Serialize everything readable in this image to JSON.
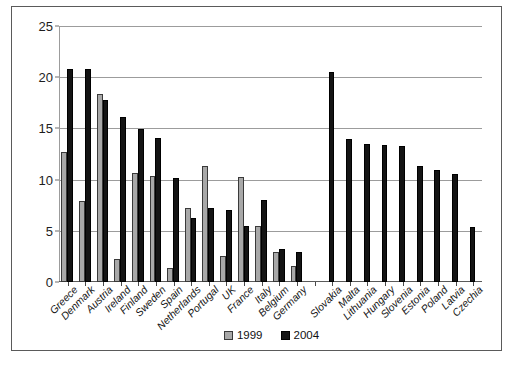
{
  "chart_data": {
    "type": "bar",
    "title": "",
    "subtitle": "",
    "xlabel": "",
    "ylabel": "",
    "ylim": [
      0,
      25
    ],
    "yticks": [
      0,
      5,
      10,
      15,
      20,
      25
    ],
    "grid": true,
    "legend_position": "bottom-center",
    "categories": [
      "Greece",
      "Denmark",
      "Austria",
      "Ireland",
      "Finland",
      "Sweden",
      "Spain",
      "Netherlands",
      "Portugal",
      "UK",
      "France",
      "Italy",
      "Belgium",
      "Germany",
      "",
      "Slovakia",
      "Malta",
      "Lithuania",
      "Hungary",
      "Slovenia",
      "Estonia",
      "Poland",
      "Latvia",
      "Czechia"
    ],
    "series": [
      {
        "name": "1999",
        "color": "#a8a8a8",
        "values": [
          12.7,
          7.9,
          18.4,
          2.2,
          10.6,
          10.4,
          1.4,
          7.2,
          11.3,
          2.5,
          10.3,
          5.5,
          2.9,
          1.6,
          null,
          null,
          null,
          null,
          null,
          null,
          null,
          null,
          null,
          null
        ]
      },
      {
        "name": "2004",
        "color": "#141414",
        "values": [
          20.8,
          20.8,
          17.8,
          16.1,
          14.9,
          14.1,
          10.2,
          6.3,
          7.2,
          7.0,
          5.5,
          8.0,
          3.2,
          2.9,
          null,
          20.5,
          14.0,
          13.5,
          13.4,
          13.3,
          11.3,
          10.9,
          10.5,
          5.4
        ]
      }
    ]
  },
  "legend": {
    "entries": [
      {
        "label": "1999",
        "swatch": "gray-square-swatch"
      },
      {
        "label": "2004",
        "swatch": "black-square-swatch"
      }
    ]
  },
  "axis": {
    "y_tick_labels": [
      "0",
      "5",
      "10",
      "15",
      "20",
      "25"
    ]
  }
}
